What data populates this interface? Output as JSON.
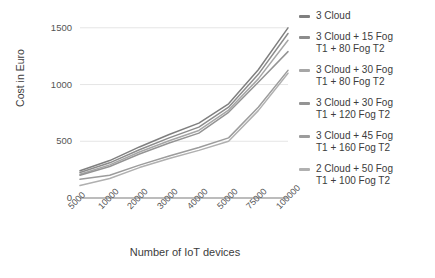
{
  "chart_data": {
    "type": "line",
    "title": "",
    "xlabel": "Number of IoT devices",
    "ylabel": "Cost in Euro",
    "categories": [
      "5000",
      "10000",
      "20000",
      "30000",
      "40000",
      "50000",
      "75000",
      "100000"
    ],
    "x_tick_labels": [
      "5000",
      "10000",
      "20000",
      "30000",
      "40000",
      "50000",
      "75000",
      "100000"
    ],
    "y_tick_labels": [
      "0",
      "500",
      "1000",
      "1500"
    ],
    "y_ticks": [
      0,
      500,
      1000,
      1500
    ],
    "ylim": [
      0,
      1560
    ],
    "grid": "horizontal",
    "legend_position": "right",
    "series": [
      {
        "name": "3 Cloud",
        "color": "#7f7f7f",
        "values": [
          240,
          330,
          450,
          560,
          660,
          830,
          1130,
          1500
        ]
      },
      {
        "name": "3 Cloud  + 15 Fog\nT1 + 80 Fog T2",
        "color": "#8c8c8c",
        "values": [
          225,
          310,
          425,
          530,
          625,
          800,
          1090,
          1450
        ]
      },
      {
        "name": "3 Cloud + 30 Fog\nT1 + 80 Fog T2",
        "color": "#a6a6a6",
        "values": [
          210,
          292,
          405,
          505,
          595,
          775,
          1050,
          1390
        ]
      },
      {
        "name": "3 Cloud + 30 Fog\nT1 + 120 Fog T2",
        "color": "#949494",
        "values": [
          200,
          278,
          388,
          485,
          572,
          755,
          1020,
          1290
        ]
      },
      {
        "name": "3 Cloud + 45 Fog\nT1 + 160 Fog T2",
        "color": "#9c9c9c",
        "values": [
          165,
          200,
          290,
          370,
          445,
          530,
          800,
          1125
        ]
      },
      {
        "name": "2 Cloud + 50 Fog\nT1 + 100 Fog T2",
        "color": "#b0b0b0",
        "values": [
          110,
          172,
          268,
          348,
          420,
          500,
          770,
          1100
        ]
      }
    ]
  }
}
